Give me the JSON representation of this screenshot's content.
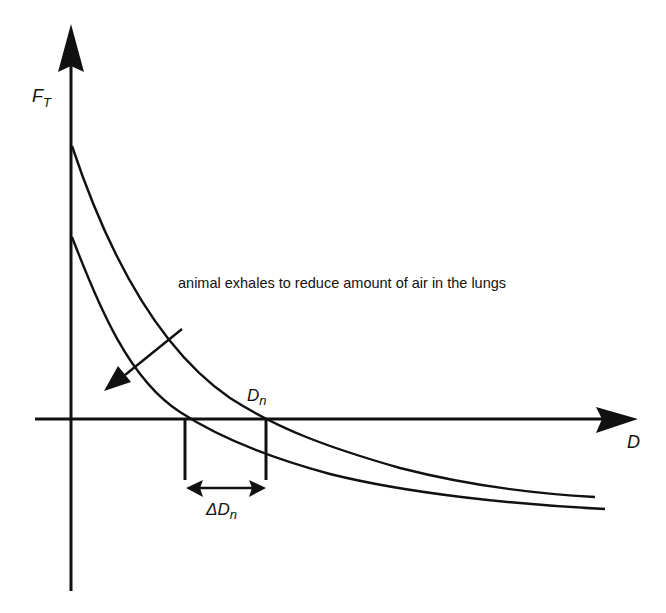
{
  "diagram": {
    "y_axis_label": "F",
    "y_axis_label_sub": "T",
    "x_axis_label": "D",
    "annotation": "animal exhales to reduce amount of air in the lungs",
    "point_label": "D",
    "point_label_sub": "n",
    "delta_label": "ΔD",
    "delta_label_sub": "n",
    "curves": [
      {
        "name": "upper-curve",
        "description": "before exhaling (more air in lungs)"
      },
      {
        "name": "lower-curve",
        "description": "after exhaling (less air in lungs)"
      }
    ],
    "colors": {
      "ink": "#111111",
      "background": "#ffffff"
    }
  }
}
